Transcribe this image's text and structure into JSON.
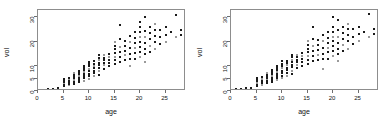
{
  "figure": {
    "background_color": "#ffffff",
    "point_color": "#1a1a1a",
    "point_color_light": "#9a9a9a",
    "axis_color": "#6e6e6e",
    "frame_color": "#8d8d8d"
  },
  "chart_data": [
    {
      "type": "scatter",
      "title": "",
      "xlabel": "age",
      "ylabel": "vol",
      "xlim": [
        0,
        29
      ],
      "ylim": [
        0,
        33
      ],
      "xticks": [
        0,
        5,
        10,
        15,
        20,
        25
      ],
      "yticks": [
        0,
        5,
        10,
        20,
        30
      ],
      "grid": false,
      "legend": null,
      "x": [
        1,
        1,
        2,
        2,
        3,
        3,
        4,
        4,
        5,
        5,
        5,
        5,
        5,
        5,
        6,
        6,
        6,
        6,
        6,
        6,
        7,
        7,
        7,
        7,
        7,
        7,
        7,
        8,
        8,
        8,
        8,
        8,
        8,
        8,
        9,
        9,
        9,
        9,
        9,
        9,
        9,
        9,
        10,
        10,
        10,
        10,
        10,
        10,
        10,
        10,
        11,
        11,
        11,
        11,
        11,
        11,
        11,
        12,
        12,
        12,
        12,
        12,
        12,
        12,
        12,
        13,
        13,
        13,
        13,
        13,
        13,
        14,
        14,
        14,
        14,
        14,
        15,
        15,
        15,
        15,
        15,
        15,
        15,
        16,
        16,
        16,
        16,
        16,
        16,
        17,
        17,
        17,
        17,
        17,
        18,
        18,
        18,
        18,
        18,
        18,
        19,
        19,
        19,
        19,
        19,
        19,
        20,
        20,
        20,
        20,
        20,
        20,
        20,
        20,
        21,
        21,
        21,
        21,
        21,
        21,
        21,
        22,
        22,
        22,
        22,
        22,
        23,
        23,
        23,
        23,
        23,
        24,
        24,
        24,
        25,
        25,
        25,
        26,
        27,
        27,
        28,
        28
      ],
      "y": [
        0.4,
        0.6,
        0.5,
        0.8,
        0.7,
        1.0,
        0.9,
        1.2,
        2.0,
        2.6,
        3.2,
        3.8,
        4.4,
        5.0,
        2.4,
        3.0,
        3.6,
        4.2,
        4.8,
        5.4,
        3.0,
        3.8,
        4.5,
        5.2,
        5.9,
        6.6,
        7.2,
        3.6,
        4.4,
        5.2,
        6.0,
        6.8,
        7.5,
        8.2,
        4.2,
        5.2,
        6.0,
        6.8,
        7.6,
        8.4,
        9.2,
        10.0,
        5.0,
        6.0,
        7.0,
        8.0,
        9.0,
        10.0,
        11.0,
        12.0,
        6.0,
        7.2,
        8.2,
        9.2,
        10.2,
        11.2,
        12.2,
        6.5,
        8.0,
        9.5,
        10.5,
        11.5,
        12.5,
        13.5,
        14.5,
        9.0,
        10.5,
        11.5,
        12.5,
        13.5,
        14.5,
        10.0,
        11.5,
        12.8,
        14.0,
        15.2,
        11.0,
        12.5,
        14.0,
        15.5,
        17.0,
        18.5,
        20.0,
        12.0,
        14.0,
        16.0,
        18.0,
        21.0,
        27.0,
        12.5,
        14.5,
        16.5,
        18.5,
        20.5,
        10.0,
        13.0,
        15.0,
        17.5,
        20.0,
        22.5,
        13.0,
        15.5,
        17.5,
        19.5,
        21.5,
        24.0,
        14.0,
        16.0,
        18.0,
        20.0,
        22.0,
        24.0,
        26.0,
        28.0,
        12.0,
        15.0,
        17.0,
        19.5,
        22.0,
        24.5,
        30.0,
        16.0,
        18.5,
        21.0,
        23.5,
        26.0,
        17.0,
        20.0,
        22.5,
        25.0,
        27.5,
        19.0,
        22.0,
        25.0,
        20.0,
        23.0,
        26.0,
        24.0,
        22.0,
        31.0,
        23.0,
        25.0
      ]
    },
    {
      "type": "scatter",
      "title": "",
      "xlabel": "age",
      "ylabel": "vol",
      "xlim": [
        0,
        29
      ],
      "ylim": [
        0,
        33
      ],
      "xticks": [
        0,
        5,
        10,
        15,
        20,
        25
      ],
      "yticks": [
        0,
        5,
        10,
        20,
        30
      ],
      "grid": false,
      "legend": null,
      "x": [
        1,
        1,
        2,
        2,
        3,
        3,
        4,
        4,
        5,
        5,
        5,
        5,
        5,
        5,
        6,
        6,
        6,
        6,
        6,
        6,
        7,
        7,
        7,
        7,
        7,
        7,
        7,
        8,
        8,
        8,
        8,
        8,
        8,
        8,
        9,
        9,
        9,
        9,
        9,
        9,
        9,
        9,
        10,
        10,
        10,
        10,
        10,
        10,
        10,
        10,
        11,
        11,
        11,
        11,
        11,
        11,
        11,
        12,
        12,
        12,
        12,
        12,
        12,
        12,
        12,
        13,
        13,
        13,
        13,
        13,
        13,
        14,
        14,
        14,
        14,
        14,
        15,
        15,
        15,
        15,
        15,
        15,
        15,
        16,
        16,
        16,
        16,
        16,
        16,
        17,
        17,
        17,
        17,
        17,
        18,
        18,
        18,
        18,
        18,
        18,
        19,
        19,
        19,
        19,
        19,
        19,
        20,
        20,
        20,
        20,
        20,
        20,
        20,
        20,
        21,
        21,
        21,
        21,
        21,
        21,
        21,
        22,
        22,
        22,
        22,
        22,
        23,
        23,
        23,
        23,
        23,
        24,
        24,
        24,
        25,
        25,
        25,
        26,
        27,
        27,
        28,
        28
      ],
      "y": [
        0.5,
        0.7,
        0.6,
        0.9,
        0.8,
        1.1,
        1.0,
        1.3,
        2.2,
        2.8,
        3.4,
        4.0,
        4.6,
        5.2,
        2.6,
        3.2,
        3.8,
        4.4,
        5.0,
        5.6,
        3.2,
        4.0,
        4.7,
        5.4,
        6.1,
        6.8,
        7.4,
        3.8,
        4.6,
        5.4,
        6.2,
        7.0,
        7.7,
        8.4,
        4.4,
        5.4,
        6.2,
        7.0,
        7.8,
        8.6,
        9.4,
        10.2,
        5.2,
        6.2,
        7.2,
        8.2,
        9.2,
        10.2,
        11.2,
        12.2,
        6.2,
        7.4,
        8.4,
        9.4,
        10.4,
        11.4,
        12.4,
        6.8,
        8.2,
        9.7,
        10.7,
        11.7,
        12.7,
        13.7,
        14.7,
        9.2,
        10.7,
        11.7,
        12.7,
        13.7,
        14.7,
        10.2,
        11.7,
        13.0,
        14.2,
        15.4,
        11.2,
        12.7,
        14.2,
        15.7,
        17.2,
        18.7,
        20.2,
        12.2,
        14.2,
        16.2,
        18.2,
        21.2,
        26.0,
        12.7,
        14.7,
        16.7,
        18.7,
        20.7,
        9.0,
        13.2,
        15.2,
        17.7,
        20.2,
        22.7,
        13.2,
        15.7,
        17.7,
        19.7,
        21.7,
        24.2,
        14.2,
        16.2,
        18.2,
        20.2,
        22.2,
        24.2,
        26.2,
        30.0,
        12.2,
        15.2,
        17.2,
        19.7,
        22.2,
        24.7,
        29.0,
        16.2,
        18.7,
        21.2,
        23.7,
        26.2,
        17.2,
        20.2,
        22.7,
        25.2,
        27.2,
        19.2,
        22.2,
        25.2,
        20.2,
        23.2,
        26.2,
        24.2,
        22.2,
        31.5,
        23.2,
        25.2
      ]
    }
  ]
}
